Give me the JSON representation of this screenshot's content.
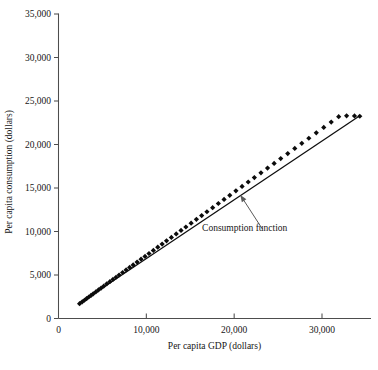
{
  "chart_data": {
    "type": "scatter",
    "title": "",
    "subtitle": "",
    "xlabel": "Per capita GDP (dollars)",
    "ylabel": "Per capita consumption (dollars)",
    "xlim": [
      0,
      35500
    ],
    "ylim": [
      0,
      35000
    ],
    "grid": false,
    "legend_position": "none",
    "xticks": [
      0,
      10000,
      20000,
      30000
    ],
    "xticklabels": [
      "0",
      "10,000",
      "20,000",
      "30,000"
    ],
    "yticks": [
      0,
      5000,
      10000,
      15000,
      20000,
      25000,
      30000,
      35000
    ],
    "yticklabels": [
      "0",
      "5,000",
      "10,000",
      "15,000",
      "20,000",
      "25,000",
      "30,000",
      "35,000"
    ],
    "series": [
      {
        "name": "Country observations",
        "marker": "diamond",
        "color": "#0b0b0b",
        "x": [
          2400,
          2700,
          2950,
          3200,
          3450,
          3700,
          3950,
          4250,
          4550,
          4850,
          5150,
          5500,
          5850,
          6200,
          6550,
          6900,
          7300,
          7700,
          8100,
          8500,
          8950,
          9400,
          9850,
          10300,
          10800,
          11300,
          11800,
          12300,
          12850,
          13400,
          13950,
          14500,
          15100,
          15700,
          16300,
          16900,
          17550,
          18200,
          18850,
          19500,
          20200,
          20900,
          21600,
          22300,
          23050,
          23800,
          24550,
          25300,
          26100,
          26900,
          27700,
          28500,
          29350,
          30200,
          31050,
          31900,
          32800,
          33700,
          34300
        ],
        "y": [
          1700,
          1920,
          2100,
          2290,
          2470,
          2650,
          2840,
          3060,
          3280,
          3500,
          3720,
          3980,
          4230,
          4490,
          4740,
          5000,
          5290,
          5580,
          5870,
          6160,
          6490,
          6820,
          7140,
          7470,
          7830,
          8200,
          8560,
          8930,
          9320,
          9720,
          10120,
          10520,
          10960,
          11400,
          11830,
          12270,
          12740,
          13220,
          13690,
          14160,
          14670,
          15180,
          15690,
          16200,
          16740,
          17290,
          17830,
          18380,
          18960,
          19550,
          20130,
          20720,
          21340,
          21960,
          22580,
          23200,
          23300,
          23280,
          23250
        ]
      }
    ],
    "fit_line": {
      "name": "Consumption function",
      "x0": 2400,
      "y0": 1750,
      "x1": 34300,
      "y1": 23300,
      "color": "#0d0d0d"
    },
    "annotations": [
      {
        "text": "Consumption function",
        "text_x": 21200,
        "text_y": 10100,
        "arrow_tip_x": 20700,
        "arrow_tip_y": 14200,
        "arrow_tail_x": 23200,
        "arrow_tail_y": 10300
      }
    ]
  },
  "axes": {
    "xlabel": "Per capita GDP (dollars)",
    "ylabel": "Per capita consumption (dollars)"
  }
}
